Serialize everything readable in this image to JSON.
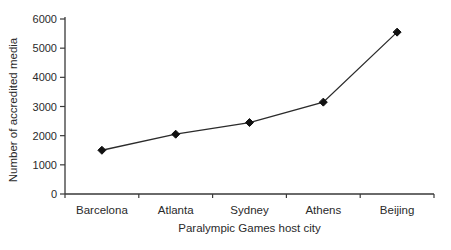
{
  "chart_data": {
    "type": "line",
    "title": "",
    "xlabel": "Paralympic Games host city",
    "ylabel": "Number of accredited media",
    "categories": [
      "Barcelona",
      "Atlanta",
      "Sydney",
      "Athens",
      "Beijing"
    ],
    "series": [
      {
        "name": "accredited-media",
        "values": [
          1500,
          2050,
          2450,
          3150,
          5550
        ]
      }
    ],
    "ylim": [
      0,
      6000
    ],
    "ytick_step": 1000,
    "yticks": [
      "0",
      "1000",
      "2000",
      "3000",
      "4000",
      "5000",
      "6000"
    ],
    "grid": false,
    "legend": "none",
    "marker": "diamond",
    "line_color": "#2b2b2b",
    "marker_color": "#111111",
    "axis_color": "#3a3a3a",
    "text_color": "#2a2a2a"
  }
}
